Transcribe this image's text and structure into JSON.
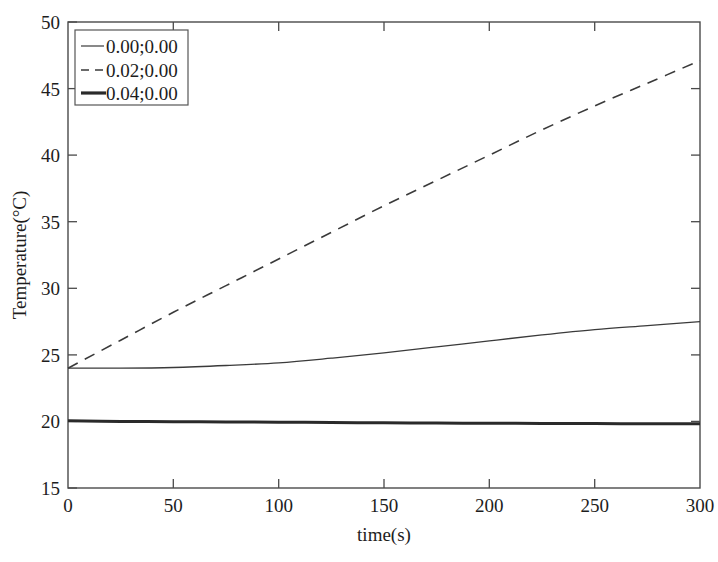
{
  "chart_data": {
    "type": "line",
    "title": "",
    "xlabel": "time(s)",
    "ylabel": "Temperature(°C)",
    "xlim": [
      0,
      300
    ],
    "ylim": [
      15,
      50
    ],
    "xticks": [
      "0",
      "50",
      "100",
      "150",
      "200",
      "250",
      "300"
    ],
    "yticks": [
      "15",
      "20",
      "25",
      "30",
      "35",
      "40",
      "45",
      "50"
    ],
    "grid": false,
    "box": true,
    "legend_position": "upper-left",
    "x": [
      0,
      25,
      50,
      75,
      100,
      125,
      150,
      175,
      200,
      225,
      250,
      275,
      300
    ],
    "series": [
      {
        "name": "0.00;0.00",
        "style": "solid-thin",
        "color": "#3a3a3a",
        "width": 1.3,
        "values": [
          24.0,
          24.0,
          24.05,
          24.2,
          24.4,
          24.75,
          25.15,
          25.6,
          26.05,
          26.5,
          26.9,
          27.2,
          27.5
        ]
      },
      {
        "name": "0.02;0.00",
        "style": "dashed",
        "color": "#3a3a3a",
        "width": 1.6,
        "values": [
          24.0,
          26.1,
          28.2,
          30.2,
          32.2,
          34.2,
          36.2,
          38.1,
          40.0,
          41.9,
          43.7,
          45.4,
          47.1
        ]
      },
      {
        "name": "0.04;0.00",
        "style": "solid-thick",
        "color": "#2a2a2a",
        "width": 3.0,
        "values": [
          20.05,
          20.0,
          19.98,
          19.96,
          19.94,
          19.92,
          19.9,
          19.88,
          19.86,
          19.85,
          19.84,
          19.83,
          19.82
        ]
      }
    ]
  },
  "legend": {
    "items": [
      {
        "label": "0.00;0.00",
        "sample": "thin-solid-line-sample"
      },
      {
        "label": "0.02;0.00",
        "sample": "dashed-line-sample"
      },
      {
        "label": "0.04;0.00",
        "sample": "thick-solid-line-sample"
      }
    ]
  },
  "axes": {
    "x_title": "time(s)",
    "y_title": "Temperature(°C)",
    "x_tick_labels": [
      "0",
      "50",
      "100",
      "150",
      "200",
      "250",
      "300"
    ],
    "y_tick_labels": [
      "15",
      "20",
      "25",
      "30",
      "35",
      "40",
      "45",
      "50"
    ]
  }
}
